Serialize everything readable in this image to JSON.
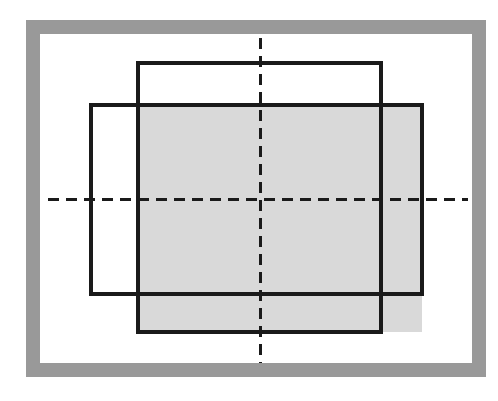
{
  "canvas": {
    "width": 498,
    "height": 401,
    "background": "#ffffff"
  },
  "frame": {
    "label": "outer-gray-border-frame",
    "x": 26,
    "y": 20,
    "width": 460,
    "height": 357,
    "border_width": 14,
    "border_color": "#999999",
    "fill_color": "#ffffff"
  },
  "figure": {
    "line_color": "#1a1a1a",
    "line_width": 4,
    "fill_color": "#d9d9d9",
    "shapes": [
      {
        "name": "tall-rectangle",
        "type": "rect",
        "x": 138,
        "y": 63,
        "width": 243,
        "height": 269,
        "stroke": "#1a1a1a",
        "stroke_width": 4,
        "fill": "none"
      },
      {
        "name": "wide-rectangle",
        "type": "rect",
        "x": 91,
        "y": 105,
        "width": 331,
        "height": 189,
        "stroke": "#1a1a1a",
        "stroke_width": 4,
        "fill": "none"
      },
      {
        "name": "shaded-overlap-region",
        "type": "rect",
        "x": 138,
        "y": 105,
        "width": 284,
        "height": 227,
        "stroke": "none",
        "fill": "#d9d9d9"
      }
    ],
    "centerlines": [
      {
        "name": "vertical-centerline",
        "orientation": "vertical",
        "x": 260,
        "y1": 38,
        "y2": 363,
        "dash": "11 7",
        "stroke": "#1a1a1a",
        "stroke_width": 3
      },
      {
        "name": "horizontal-centerline",
        "orientation": "horizontal",
        "y": 199,
        "x1": 48,
        "x2": 468,
        "dash": "11 7",
        "stroke": "#1a1a1a",
        "stroke_width": 3
      }
    ]
  }
}
